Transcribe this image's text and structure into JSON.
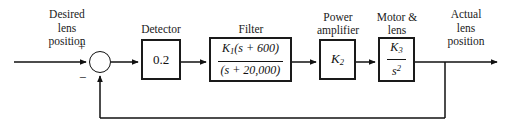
{
  "diagram": {
    "type": "control-system-block-diagram",
    "input_signal_label": "Desired\nlens\nposition",
    "output_signal_label": "Actual\nlens\nposition",
    "summing_junction": {
      "plus_sign": "+",
      "minus_sign": "−"
    },
    "blocks": [
      {
        "id": "detector",
        "label": "Detector",
        "gain_text": "0.2"
      },
      {
        "id": "filter",
        "label": "Filter",
        "numerator_gain": "K",
        "numerator_sub": "1",
        "numerator_rest": "(s + 600)",
        "denominator": "(s + 20,000)"
      },
      {
        "id": "power-amplifier",
        "label": "Power\namplifier",
        "gain_symbol": "K",
        "gain_sub": "2"
      },
      {
        "id": "motor-lens",
        "label": "Motor &\nlens",
        "numerator_gain": "K",
        "numerator_sub": "3",
        "denominator_var": "s",
        "denominator_exp": "2"
      }
    ],
    "colors": {
      "line": "#1a1a1a",
      "text": "#1a1a1a",
      "background": "#ffffff"
    }
  }
}
